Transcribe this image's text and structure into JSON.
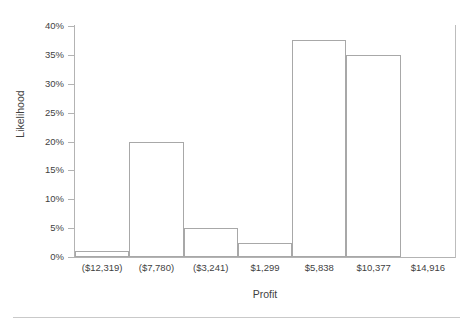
{
  "chart_data": {
    "type": "bar",
    "title": "",
    "xlabel": "Profit",
    "ylabel": "Likelihood",
    "categories": [
      "($12,319)",
      "($7,780)",
      "($3,241)",
      "$1,299",
      "$5,838",
      "$10,377",
      "$14,916"
    ],
    "values": [
      1,
      20,
      5,
      2.5,
      37.5,
      35,
      0
    ],
    "value_labels": [
      "1%",
      "20%",
      "5%",
      "2.5%",
      "37.5%",
      "35%",
      "0%"
    ],
    "ylim": [
      0,
      40
    ],
    "ytick_values": [
      0,
      5,
      10,
      15,
      20,
      25,
      30,
      35,
      40
    ],
    "ytick_labels": [
      "0%",
      "5%",
      "10%",
      "15%",
      "20%",
      "25%",
      "30%",
      "35%",
      "40%"
    ],
    "grid": false,
    "legend": null,
    "legend_position": "none",
    "bar_fill_color": "#ffffff",
    "bar_edge_color": "#a8a8a8",
    "axis_color": "#b3b3b3",
    "text_color": "#3f3f3f"
  },
  "figure": {
    "background_color": "#ffffff",
    "separator_color": "#c9c9c9"
  }
}
